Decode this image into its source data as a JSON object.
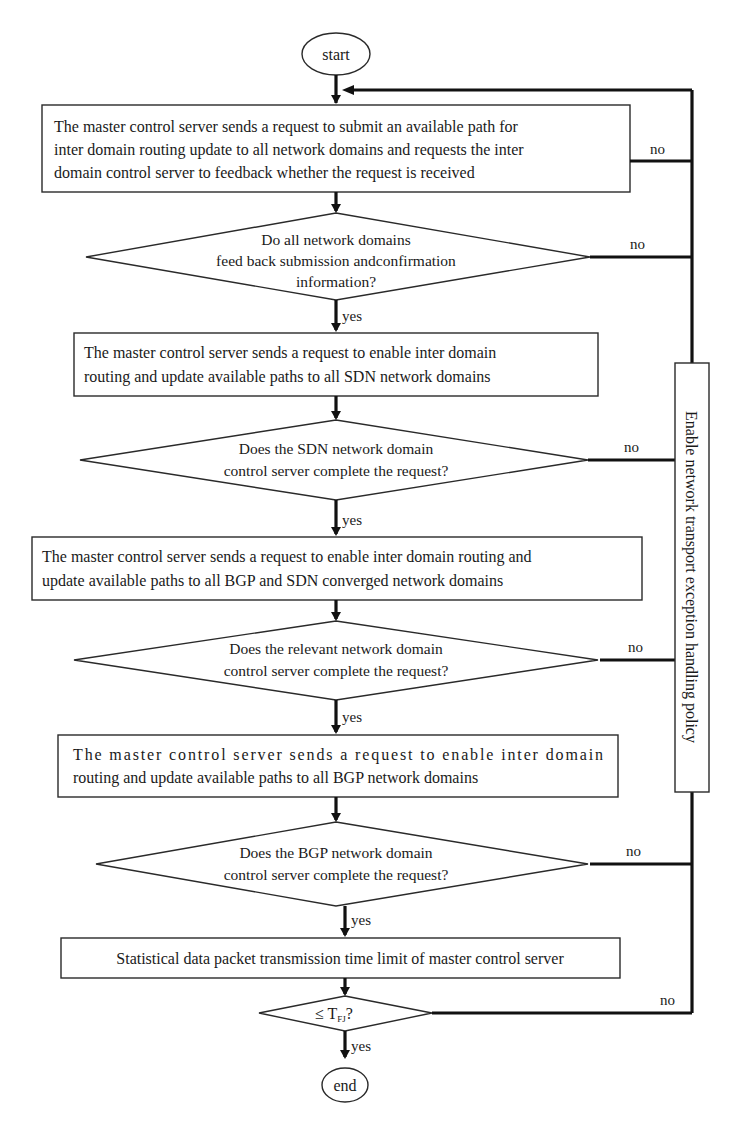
{
  "flowchart": {
    "start": "start",
    "end": "end",
    "steps": [
      {
        "type": "process",
        "lines": [
          "The master control server sends a request to submit an available path for",
          "inter domain routing update to all network domains and requests the inter",
          "domain control server to feedback whether the request is received"
        ],
        "no_label": "no"
      },
      {
        "type": "decision",
        "lines": [
          "Do all network domains",
          "feed back submission andconfirmation",
          "information?"
        ],
        "yes_label": "yes",
        "no_label": "no"
      },
      {
        "type": "process",
        "lines": [
          "The master control server sends a request to enable inter domain",
          "routing and update available paths to all SDN network domains"
        ]
      },
      {
        "type": "decision",
        "lines": [
          "Does the SDN network domain",
          "control server complete the request?"
        ],
        "yes_label": "yes",
        "no_label": "no"
      },
      {
        "type": "process",
        "lines": [
          "The master control server sends a request to enable inter domain routing and",
          "update available paths to all BGP and SDN converged network domains"
        ]
      },
      {
        "type": "decision",
        "lines": [
          "Does the relevant network domain",
          "control server complete the request?"
        ],
        "yes_label": "yes",
        "no_label": "no"
      },
      {
        "type": "process",
        "lines": [
          "The master control server sends a request to enable inter domain",
          "routing and update available paths to all BGP network domains"
        ]
      },
      {
        "type": "decision",
        "lines": [
          "Does the BGP network domain",
          "control server complete the request?"
        ],
        "yes_label": "yes",
        "no_label": "no"
      },
      {
        "type": "process",
        "lines": [
          "Statistical data packet transmission time limit of master control server"
        ]
      },
      {
        "type": "decision",
        "condition_symbol": "≤ T",
        "condition_subscript": "FJ",
        "condition_suffix": "?",
        "yes_label": "yes",
        "no_label": "no"
      }
    ],
    "exception_policy_label": "Enable network transport exception handling policy"
  }
}
